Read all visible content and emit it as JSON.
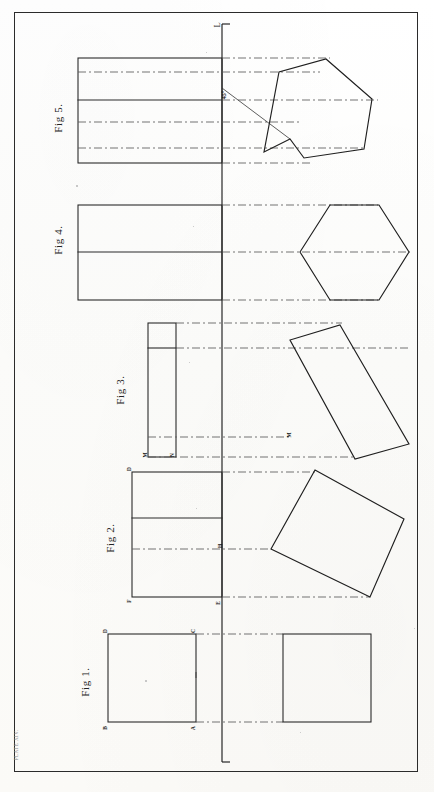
{
  "plate": {
    "caption": "PLATE XIV.",
    "width": 434,
    "height": 792,
    "background_color": "#fdfdfb",
    "ink_color": "#222222",
    "border": {
      "x": 14,
      "y": 12,
      "w": 404,
      "h": 760
    }
  },
  "ground_line": {
    "name": "XY ground line",
    "label_top": "L",
    "x": 222,
    "y_top": 24,
    "y_bottom": 762,
    "style": "solid"
  },
  "figures": [
    {
      "id": "fig5",
      "label": "Fig 5.",
      "label_x": 58,
      "label_y": 118,
      "description": "Heptagonal prism - elevation with 45 degree inclined edge and plan heptagon",
      "angle_annotation": "45°",
      "elevation": {
        "x": 78,
        "y": 58,
        "w": 144,
        "h": 105,
        "internal_solid_lines_y": [
          58,
          100,
          163
        ],
        "internal_dashed_lines_y": [
          72,
          122,
          148
        ]
      },
      "projectors_dashed_y": [
        58,
        72,
        100,
        122,
        148,
        163
      ],
      "inclined_line": {
        "x1": 222,
        "y1": 88,
        "x2": 288,
        "y2": 137
      },
      "polygon_points": "288,137 260,151 277,72 325,60 372,98 365,148 303,157"
    },
    {
      "id": "fig4",
      "label": "Fig 4.",
      "label_x": 58,
      "label_y": 240,
      "description": "Hexagonal prism - elevation rectangle and plan hexagon",
      "elevation": {
        "x": 78,
        "y": 205,
        "w": 144,
        "h": 95
      },
      "centre_line_y": 252,
      "projectors_dashed_y": [
        205,
        252,
        300
      ],
      "polygon_points": "300,252 330,205 380,205 408,252 380,300 330,300"
    },
    {
      "id": "fig3",
      "label": "Fig 3.",
      "label_x": 120,
      "label_y": 390,
      "description": "Tilted rectangular plate - narrow elevation and inclined plan rectangle",
      "elevation": {
        "x": 148,
        "y": 323,
        "w": 28,
        "h": 134
      },
      "elevation_internal_line_y": 348,
      "projectors_dashed_y": [
        323,
        348,
        437,
        457
      ],
      "plan_points": "340,325 408,443 354,458 290,341",
      "point_labels": [
        {
          "text": "M",
          "x": 144,
          "y": 452
        },
        {
          "text": "N",
          "x": 172,
          "y": 452
        },
        {
          "text": "M",
          "x": 288,
          "y": 434
        }
      ]
    },
    {
      "id": "fig2",
      "label": "Fig 2.",
      "label_x": 110,
      "label_y": 538,
      "description": "Tilted square - elevation rectangle and rotated plan square",
      "elevation": {
        "x": 132,
        "y": 472,
        "w": 90,
        "h": 125
      },
      "elevation_internal_line_y": 518,
      "centre_line_y": 549,
      "projectors_dashed_y": [
        472,
        549,
        597
      ],
      "plan_points": "315,470 404,518 370,597 271,549",
      "point_labels": [
        {
          "text": "D",
          "x": 130,
          "y": 468
        },
        {
          "text": "F",
          "x": 130,
          "y": 597
        },
        {
          "text": "E",
          "x": 222,
          "y": 599
        },
        {
          "text": "H",
          "x": 224,
          "y": 545
        }
      ]
    },
    {
      "id": "fig1",
      "label": "Fig 1.",
      "label_x": 85,
      "label_y": 682,
      "description": "Square prism - front elevation square and plan square",
      "elevation": {
        "x": 108,
        "y": 634,
        "w": 88,
        "h": 88
      },
      "projectors_dashed_y": [
        634,
        722
      ],
      "plan": {
        "x": 282,
        "y": 634,
        "w": 88,
        "h": 88
      },
      "point_labels": [
        {
          "text": "D",
          "x": 106,
          "y": 631
        },
        {
          "text": "C",
          "x": 194,
          "y": 631
        },
        {
          "text": "B",
          "x": 106,
          "y": 724
        },
        {
          "text": "A",
          "x": 194,
          "y": 724
        }
      ]
    }
  ]
}
